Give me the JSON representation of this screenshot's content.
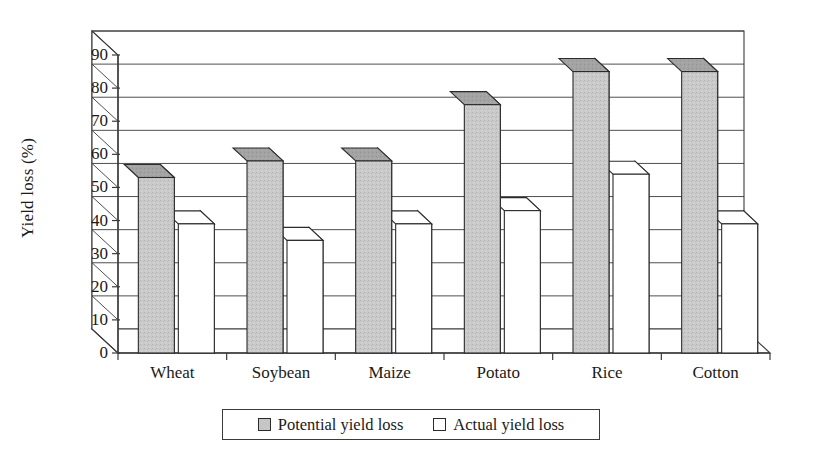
{
  "chart_data": {
    "type": "bar",
    "title": "",
    "subtitle": "",
    "xlabel": "",
    "ylabel": "Yield loss (%)",
    "categories": [
      "Wheat",
      "Soybean",
      "Maize",
      "Potato",
      "Rice",
      "Cotton"
    ],
    "series": [
      {
        "name": "Potential yield loss",
        "values": [
          53,
          58,
          58,
          75,
          85,
          85
        ],
        "color": "#c6c6c6"
      },
      {
        "name": "Actual yield loss",
        "values": [
          39,
          34,
          39,
          43,
          54,
          39
        ],
        "color": "#ffffff"
      }
    ],
    "ylim": [
      0,
      90
    ],
    "ytick_labels": [
      "0",
      "10",
      "20",
      "30",
      "40",
      "50",
      "60",
      "70",
      "80",
      "90"
    ],
    "ytick_values": [
      0,
      10,
      20,
      30,
      40,
      50,
      60,
      70,
      80,
      90
    ],
    "grid": true,
    "grid_axis": "y",
    "legend_position": "bottom",
    "style": "3d-column",
    "background": "#ffffff",
    "axis_color": "#3b3b3b"
  },
  "legend": {
    "entries": [
      {
        "label": "Potential yield loss",
        "swatch": "gray-swatch-icon"
      },
      {
        "label": "Actual yield loss",
        "swatch": "white-swatch-icon"
      }
    ]
  }
}
